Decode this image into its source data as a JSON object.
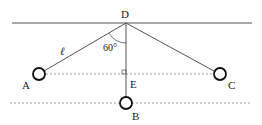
{
  "diagram": {
    "labels": {
      "D": "D",
      "A": "A",
      "B": "B",
      "C": "C",
      "E": "E",
      "length": "ℓ",
      "angle": "60°"
    },
    "colors": {
      "line": "#444444",
      "dotted": "#888888",
      "ball": "#111111"
    }
  }
}
